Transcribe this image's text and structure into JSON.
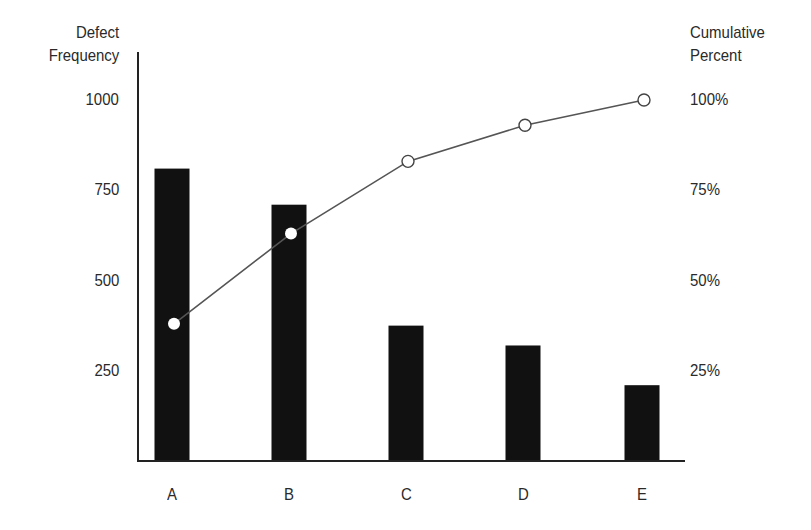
{
  "chart_data": {
    "type": "bar",
    "title": "",
    "xlabel": "",
    "ylabel": "Defect Frequency",
    "y2label": "Cumulative Percent",
    "categories": [
      "A",
      "B",
      "C",
      "D",
      "E"
    ],
    "series": [
      {
        "name": "Defect Frequency",
        "type": "bar",
        "axis": "left",
        "values": [
          810,
          710,
          375,
          320,
          210
        ]
      },
      {
        "name": "Cumulative Percent",
        "type": "line",
        "axis": "right",
        "values": [
          38,
          63,
          83,
          93,
          100
        ]
      }
    ],
    "ylim": [
      0,
      1000
    ],
    "y2lim": [
      0,
      100
    ],
    "yticks": [
      "250",
      "500",
      "750",
      "1000"
    ],
    "y2ticks": [
      "25%",
      "50%",
      "75%",
      "100%"
    ],
    "grid": false,
    "legend": "none",
    "colors": {
      "bar": "#111111",
      "line": "#555555",
      "marker_fill": "#ffffff"
    }
  },
  "axes": {
    "left_title_line1": "Defect",
    "left_title_line2": "Frequency",
    "right_title_line1": "Cumulative",
    "right_title_line2": "Percent"
  }
}
